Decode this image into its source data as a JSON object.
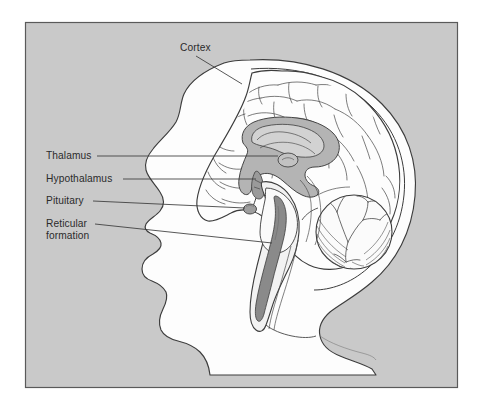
{
  "figure": {
    "panel": {
      "background_color": "#c9c9c9",
      "border_color": "#5a5a5a",
      "page_background": "#ffffff"
    },
    "artwork": {
      "subject": "human-head-profile-left-facing",
      "style": "line-drawing-with-gray-shading",
      "outline_color": "#3c3c3c",
      "head_fill": "#fdfdfd",
      "shade_light": "#e6e6e6",
      "shade_medium": "#b4b4b4",
      "shade_dark": "#8e8e8e"
    }
  },
  "labels": [
    {
      "id": "cortex",
      "name": "Cortex",
      "text": "Cortex",
      "lines": [
        "Cortex"
      ],
      "leader": "diagonal",
      "anchor": "top"
    },
    {
      "id": "thalamus",
      "name": "Thalamus",
      "text": "Thalamus",
      "lines": [
        "Thalamus"
      ],
      "leader": "horizontal",
      "anchor": "left"
    },
    {
      "id": "hypothalamus",
      "name": "Hypothalamus",
      "text": "Hypothalamus",
      "lines": [
        "Hypothalamus"
      ],
      "leader": "horizontal",
      "anchor": "left"
    },
    {
      "id": "pituitary",
      "name": "Pituitary",
      "text": "Pituitary",
      "lines": [
        "Pituitary"
      ],
      "leader": "horizontal",
      "anchor": "left"
    },
    {
      "id": "reticular-formation",
      "name": "Reticular formation",
      "text": "Reticular formation",
      "lines": [
        "Reticular",
        "formation"
      ],
      "line1": "Reticular",
      "line2": "formation",
      "leader": "horizontal",
      "anchor": "left"
    }
  ],
  "structures": [
    {
      "id": "skull",
      "name": "Skull outline"
    },
    {
      "id": "cerebral-cortex",
      "name": "Cerebral cortex"
    },
    {
      "id": "corpus-callosum",
      "name": "Corpus callosum"
    },
    {
      "id": "thalamus-mass",
      "name": "Thalamus"
    },
    {
      "id": "hypothalamus-region",
      "name": "Hypothalamus"
    },
    {
      "id": "pituitary-gland",
      "name": "Pituitary gland"
    },
    {
      "id": "cerebellum",
      "name": "Cerebellum"
    },
    {
      "id": "brainstem",
      "name": "Brainstem"
    },
    {
      "id": "reticular-core",
      "name": "Reticular formation core"
    },
    {
      "id": "spinal-cord",
      "name": "Spinal cord"
    }
  ]
}
